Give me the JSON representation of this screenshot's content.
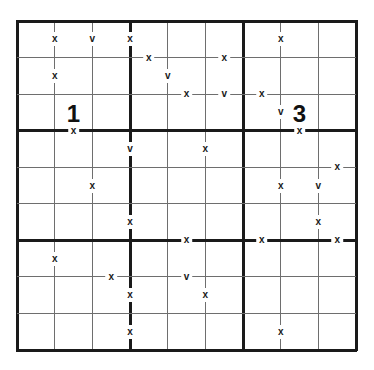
{
  "puzzle": {
    "type": "XV Sudoku",
    "rows": 9,
    "cols": 9,
    "box_size": 3,
    "colors": {
      "line_thin": "#6e6e6e",
      "line_thick": "#1a1a1a",
      "background": "#ffffff",
      "marker": "#1a1a1a"
    },
    "box_labels": [
      {
        "text": "1",
        "row": 3,
        "col": 2
      },
      {
        "text": "3",
        "row": 3,
        "col": 8
      }
    ],
    "vertical_edge_markers": [
      {
        "row": 1,
        "col": 1,
        "symbol": "x"
      },
      {
        "row": 1,
        "col": 2,
        "symbol": "v"
      },
      {
        "row": 1,
        "col": 3,
        "symbol": "x"
      },
      {
        "row": 1,
        "col": 7,
        "symbol": "x"
      },
      {
        "row": 2,
        "col": 1,
        "symbol": "x"
      },
      {
        "row": 2,
        "col": 4,
        "symbol": "v"
      },
      {
        "row": 3,
        "col": 7,
        "symbol": "v"
      },
      {
        "row": 4,
        "col": 3,
        "symbol": "v"
      },
      {
        "row": 4,
        "col": 5,
        "symbol": "x"
      },
      {
        "row": 5,
        "col": 2,
        "symbol": "x"
      },
      {
        "row": 5,
        "col": 7,
        "symbol": "x"
      },
      {
        "row": 5,
        "col": 8,
        "symbol": "v"
      },
      {
        "row": 6,
        "col": 3,
        "symbol": "x"
      },
      {
        "row": 6,
        "col": 8,
        "symbol": "x"
      },
      {
        "row": 7,
        "col": 1,
        "symbol": "x"
      },
      {
        "row": 8,
        "col": 3,
        "symbol": "x"
      },
      {
        "row": 8,
        "col": 5,
        "symbol": "x"
      },
      {
        "row": 9,
        "col": 3,
        "symbol": "x"
      },
      {
        "row": 9,
        "col": 7,
        "symbol": "x"
      }
    ],
    "horizontal_edge_markers": [
      {
        "row": 1,
        "col": 4,
        "symbol": "x"
      },
      {
        "row": 1,
        "col": 6,
        "symbol": "x"
      },
      {
        "row": 2,
        "col": 5,
        "symbol": "x"
      },
      {
        "row": 2,
        "col": 6,
        "symbol": "v"
      },
      {
        "row": 2,
        "col": 7,
        "symbol": "x"
      },
      {
        "row": 3,
        "col": 2,
        "symbol": "x"
      },
      {
        "row": 3,
        "col": 8,
        "symbol": "x"
      },
      {
        "row": 4,
        "col": 9,
        "symbol": "x"
      },
      {
        "row": 6,
        "col": 5,
        "symbol": "x"
      },
      {
        "row": 6,
        "col": 7,
        "symbol": "x"
      },
      {
        "row": 6,
        "col": 9,
        "symbol": "x"
      },
      {
        "row": 7,
        "col": 3,
        "symbol": "x"
      },
      {
        "row": 7,
        "col": 5,
        "symbol": "v"
      }
    ]
  }
}
